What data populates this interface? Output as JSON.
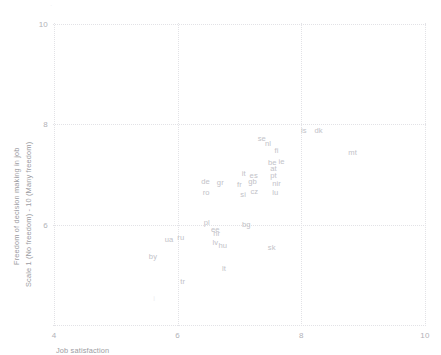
{
  "chart_data": {
    "type": "scatter",
    "title": "",
    "xlabel": "Job satisfaction",
    "ylabel_line1": "Freedom of decision making in job",
    "ylabel_line2": "Scale 1 (No freedom) - 10 (Many freedom)",
    "xlim": [
      4,
      10
    ],
    "ylim": [
      4,
      10
    ],
    "xticks": [
      4,
      6,
      8,
      10
    ],
    "yticks": [
      6,
      8,
      10
    ],
    "xtick_labels": [
      "4",
      "6",
      "8",
      "10"
    ],
    "ytick_labels": [
      "6",
      "8",
      "10"
    ],
    "grid": true,
    "grid_style": "dotted",
    "legend": "none",
    "marker_style": "text-label",
    "points": [
      {
        "label": "dk",
        "x": 8.28,
        "y": 7.88
      },
      {
        "label": "is",
        "x": 8.04,
        "y": 7.88
      },
      {
        "label": "se",
        "x": 7.36,
        "y": 7.73
      },
      {
        "label": "nl",
        "x": 7.46,
        "y": 7.62
      },
      {
        "label": "fi",
        "x": 7.6,
        "y": 7.49
      },
      {
        "label": "mt",
        "x": 8.83,
        "y": 7.45
      },
      {
        "label": "ie",
        "x": 7.68,
        "y": 7.26
      },
      {
        "label": "be",
        "x": 7.53,
        "y": 7.24
      },
      {
        "label": "at",
        "x": 7.55,
        "y": 7.12
      },
      {
        "label": "es",
        "x": 7.23,
        "y": 7.0
      },
      {
        "label": "it",
        "x": 7.07,
        "y": 7.02
      },
      {
        "label": "pt",
        "x": 7.55,
        "y": 7.0
      },
      {
        "label": "gb",
        "x": 7.21,
        "y": 6.88
      },
      {
        "label": "de",
        "x": 6.45,
        "y": 6.88
      },
      {
        "label": "gr",
        "x": 6.69,
        "y": 6.85
      },
      {
        "label": "fr",
        "x": 7.0,
        "y": 6.82
      },
      {
        "label": "nir",
        "x": 7.6,
        "y": 6.84
      },
      {
        "label": "cz",
        "x": 7.24,
        "y": 6.67
      },
      {
        "label": "lu",
        "x": 7.58,
        "y": 6.66
      },
      {
        "label": "si",
        "x": 7.06,
        "y": 6.62
      },
      {
        "label": "ro",
        "x": 6.46,
        "y": 6.66
      },
      {
        "label": "bg",
        "x": 7.11,
        "y": 6.02
      },
      {
        "label": "pl",
        "x": 6.47,
        "y": 6.06
      },
      {
        "label": "ee",
        "x": 6.61,
        "y": 5.92
      },
      {
        "label": "hr",
        "x": 6.63,
        "y": 5.83
      },
      {
        "label": "ru",
        "x": 6.05,
        "y": 5.76
      },
      {
        "label": "ua",
        "x": 5.86,
        "y": 5.72
      },
      {
        "label": "lv",
        "x": 6.61,
        "y": 5.66
      },
      {
        "label": "hu",
        "x": 6.73,
        "y": 5.6
      },
      {
        "label": "sk",
        "x": 7.52,
        "y": 5.56
      },
      {
        "label": "by",
        "x": 5.6,
        "y": 5.38
      },
      {
        "label": "lt",
        "x": 6.75,
        "y": 5.13
      },
      {
        "label": "tr",
        "x": 6.08,
        "y": 4.87
      }
    ],
    "faint_points": [
      {
        "label": "i",
        "x": 5.62,
        "y": 4.53
      }
    ]
  },
  "colors": {
    "background": "#ffffff",
    "grid": "#e2e2e6",
    "tick_text": "#b2b2b8",
    "axis_title_text": "#9c9ca2",
    "point_label": "#c2c2c8"
  }
}
